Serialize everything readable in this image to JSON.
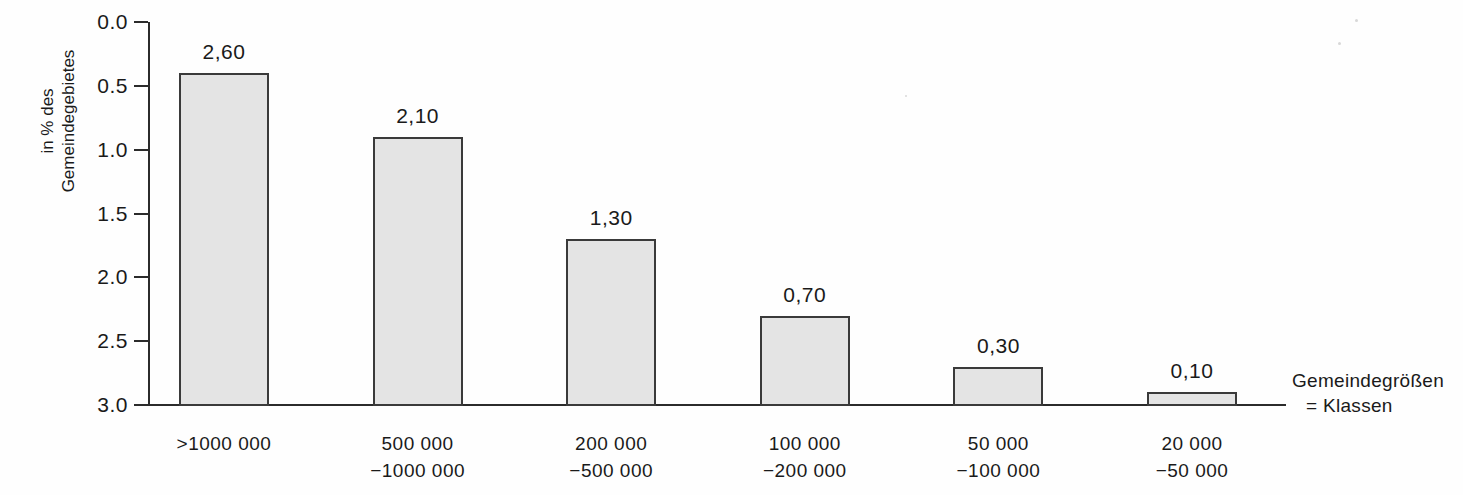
{
  "chart_data": {
    "type": "bar",
    "title": "",
    "subtitle": "",
    "xlabel": "",
    "ylabel": "in % des Gemeindegebietes",
    "ylabel_lines": [
      "in % des",
      "Gemeindegebietes"
    ],
    "ylim": [
      0.0,
      3.0
    ],
    "ytick_values": [
      0.0,
      0.5,
      1.0,
      1.5,
      2.0,
      2.5,
      3.0
    ],
    "ytick_labels": [
      "0.0",
      "0.5",
      "1.0",
      "1.5",
      "2.0",
      "2.5",
      "3.0"
    ],
    "grid": false,
    "legend": null,
    "categories": [
      ">1000 000",
      "500 000 −1000 000",
      "200 000 −500 000",
      "100 000 −200 000",
      "50 000 −100 000",
      "20 000 −50 000"
    ],
    "category_label_lines": [
      [
        ">1000 000"
      ],
      [
        "500 000",
        "−1000 000"
      ],
      [
        "200 000",
        "−500 000"
      ],
      [
        "100 000",
        "−200 000"
      ],
      [
        "50 000",
        "−100 000"
      ],
      [
        "20 000",
        "−50 000"
      ]
    ],
    "values": [
      2.6,
      2.1,
      1.3,
      0.7,
      0.3,
      0.1
    ],
    "value_labels": [
      "2,60",
      "2,10",
      "1,30",
      "0,70",
      "0,30",
      "0,10"
    ],
    "annotations": [
      {
        "lines": [
          "Gemeindegrößen",
          "= Klassen"
        ]
      }
    ],
    "colors": {
      "bar_fill": "#e4e4e4",
      "bar_stroke": "#3a3a3a",
      "axis": "#2b2b2b",
      "text": "#1a1a1a",
      "background": "#fefefe"
    }
  },
  "yticks": [
    {
      "label": "3.0"
    },
    {
      "label": "2.5"
    },
    {
      "label": "2.0"
    },
    {
      "label": "1.5"
    },
    {
      "label": "1.0"
    },
    {
      "label": "0.5"
    },
    {
      "label": "0.0"
    }
  ],
  "bars": [
    {
      "value_label": "2,60",
      "cat_line1": ">1000 000",
      "cat_line2": ""
    },
    {
      "value_label": "2,10",
      "cat_line1": "500 000",
      "cat_line2": "−1000 000"
    },
    {
      "value_label": "1,30",
      "cat_line1": "200 000",
      "cat_line2": "−500 000"
    },
    {
      "value_label": "0,70",
      "cat_line1": "100 000",
      "cat_line2": "−200 000"
    },
    {
      "value_label": "0,30",
      "cat_line1": "50 000",
      "cat_line2": "−100 000"
    },
    {
      "value_label": "0,10",
      "cat_line1": "20 000",
      "cat_line2": "−50 000"
    }
  ],
  "y_axis_title": {
    "line1": "in % des",
    "line2": "Gemeindegebietes"
  },
  "annotation": {
    "line1": "Gemeindegrößen",
    "line2": "= Klassen"
  }
}
